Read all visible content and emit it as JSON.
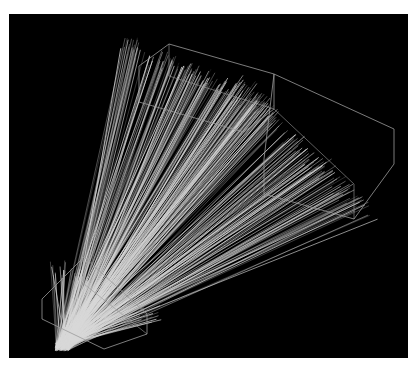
{
  "figure": {
    "background": "#ffffff",
    "panel": {
      "x": 9,
      "y": 14,
      "w": 399,
      "h": 344,
      "color": "#000000"
    },
    "line_color": "#d8d8d8",
    "box_color": "#9a9a9a",
    "origin": [
      53,
      333
    ],
    "bundles": [
      {
        "name": "left-bundle",
        "count": 170,
        "target_from": [
          120,
          30
        ],
        "target_to": [
          270,
          100
        ],
        "seed": 7
      },
      {
        "name": "right-bundle",
        "count": 170,
        "target_from": [
          230,
          70
        ],
        "target_to": [
          360,
          200
        ],
        "seed": 13
      },
      {
        "name": "lower-fan",
        "count": 90,
        "target_from": [
          40,
          250
        ],
        "target_to": [
          150,
          300
        ],
        "seed": 29,
        "short": true
      }
    ],
    "boxes": [
      {
        "name": "upper-left-box",
        "points": [
          [
            130,
            52
          ],
          [
            160,
            30
          ],
          [
            265,
            60
          ],
          [
            265,
            95
          ],
          [
            235,
            118
          ],
          [
            130,
            88
          ]
        ],
        "inner": [
          [
            160,
            30
          ],
          [
            160,
            62
          ],
          [
            265,
            95
          ]
        ]
      },
      {
        "name": "upper-right-box",
        "points": [
          [
            265,
            60
          ],
          [
            385,
            115
          ],
          [
            385,
            150
          ],
          [
            345,
            205
          ],
          [
            255,
            180
          ],
          [
            255,
            145
          ]
        ],
        "inner": [
          [
            265,
            95
          ],
          [
            345,
            170
          ],
          [
            345,
            205
          ]
        ]
      },
      {
        "name": "lower-box",
        "points": [
          [
            33,
            285
          ],
          [
            75,
            243
          ],
          [
            138,
            300
          ],
          [
            138,
            320
          ],
          [
            95,
            335
          ],
          [
            33,
            305
          ]
        ],
        "inner": [
          [
            75,
            243
          ],
          [
            75,
            270
          ],
          [
            138,
            320
          ]
        ]
      }
    ]
  }
}
